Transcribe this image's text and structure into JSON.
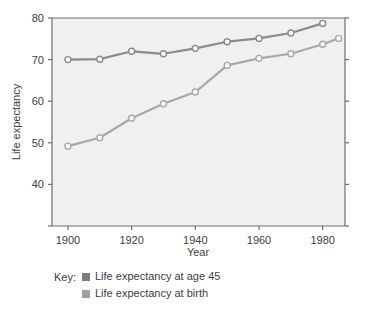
{
  "chart_data": {
    "type": "line",
    "title": "",
    "xlabel": "Year",
    "ylabel": "Life expectancy",
    "xlim": [
      1895,
      1987
    ],
    "ylim": [
      30,
      80
    ],
    "xticks": [
      1900,
      1920,
      1940,
      1960,
      1980
    ],
    "yticks": [
      40,
      50,
      60,
      70,
      80
    ],
    "ytick_labels": [
      "40",
      "50",
      "60",
      "70",
      "80"
    ],
    "xtick_labels": [
      "1900",
      "1920",
      "1940",
      "1960",
      "1980"
    ],
    "grid": false,
    "legend_position": "below",
    "series": [
      {
        "name": "Life expectancy at age 45",
        "color": "#8b8b8b",
        "x": [
          1900,
          1910,
          1920,
          1930,
          1940,
          1950,
          1960,
          1970,
          1980
        ],
        "values": [
          70.0,
          70.1,
          72.0,
          71.4,
          72.7,
          74.3,
          75.1,
          76.4,
          78.7
        ]
      },
      {
        "name": "Life expectancy at birth",
        "color": "#a8a8a8",
        "x": [
          1900,
          1910,
          1920,
          1930,
          1940,
          1950,
          1960,
          1970,
          1980,
          1985
        ],
        "values": [
          49.2,
          51.2,
          55.9,
          59.4,
          62.2,
          68.6,
          70.3,
          71.4,
          73.7,
          75.1
        ]
      }
    ]
  },
  "legend": {
    "key_label": "Key:",
    "items": [
      {
        "label": "Life expectancy at age 45",
        "color": "#7d7d7d"
      },
      {
        "label": "Life expectancy at birth",
        "color": "#a0a0a0"
      }
    ]
  },
  "colors": {
    "plot_background": "#f0f0f0",
    "axis": "#6e6e6e",
    "text": "#3d3d3d",
    "series_age45": "#8b8b8b",
    "series_birth": "#a8a8a8",
    "marker_fill": "#fafafa"
  }
}
